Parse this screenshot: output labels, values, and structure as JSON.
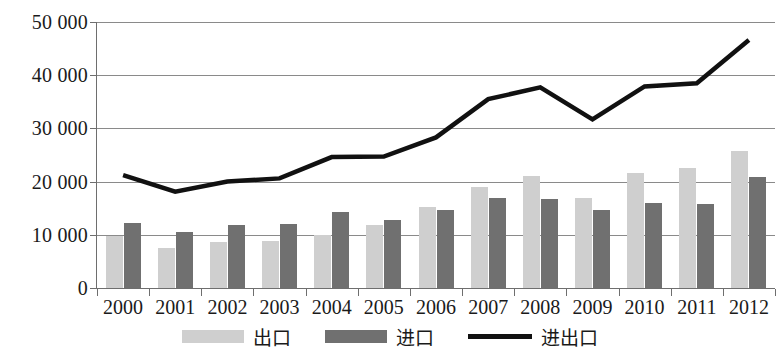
{
  "chart_data": {
    "type": "bar",
    "title": "",
    "xlabel": "",
    "ylabel": "",
    "grid": true,
    "legend_position": "bottom",
    "ylim": [
      0,
      50000
    ],
    "yticks": [
      0,
      10000,
      20000,
      30000,
      40000,
      50000
    ],
    "ytick_labels": [
      "0",
      "10 000",
      "20 000",
      "30 000",
      "40 000",
      "50 000"
    ],
    "categories": [
      "2000",
      "2001",
      "2002",
      "2003",
      "2004",
      "2005",
      "2006",
      "2007",
      "2008",
      "2009",
      "2010",
      "2011",
      "2012"
    ],
    "series": [
      {
        "name": "出口",
        "kind": "bar",
        "color": "#cfcfcf",
        "values": [
          9800,
          7500,
          8700,
          8900,
          10000,
          11900,
          15300,
          18900,
          21100,
          17000,
          21700,
          22600,
          25700
        ]
      },
      {
        "name": "进口",
        "kind": "bar",
        "color": "#707070",
        "values": [
          12200,
          10500,
          11900,
          12100,
          14300,
          12800,
          14700,
          17000,
          16800,
          14700,
          15900,
          15700,
          20900
        ]
      },
      {
        "name": "进出口",
        "kind": "line",
        "color": "#111111",
        "values": [
          21200,
          18100,
          20000,
          20600,
          24600,
          24700,
          28300,
          35500,
          37700,
          31700,
          37900,
          38500,
          46600
        ]
      }
    ]
  },
  "legend": {
    "items": [
      {
        "label": "出口",
        "swatch": "bar-light-swatch"
      },
      {
        "label": "进口",
        "swatch": "bar-dark-swatch"
      },
      {
        "label": "进出口",
        "swatch": "line-swatch"
      }
    ]
  },
  "colors": {
    "export_bar": "#cfcfcf",
    "import_bar": "#707070",
    "total_line": "#111111",
    "gridline": "#8a8a8a",
    "axis": "#6e6e6e",
    "text": "#1a1a1a",
    "background": "#ffffff"
  }
}
